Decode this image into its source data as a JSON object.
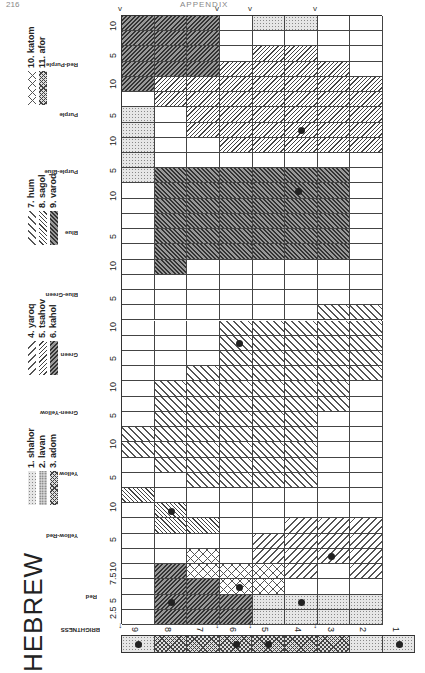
{
  "page": {
    "number": "216",
    "running_head": "APPENDIX"
  },
  "language_title": "HEBREW",
  "legend": [
    {
      "id": 1,
      "label": "1. shahor",
      "pattern": "stipple-light"
    },
    {
      "id": 2,
      "label": "2. lavan",
      "pattern": "stipple-medium"
    },
    {
      "id": 3,
      "label": "3. adom",
      "pattern": "stipple-dense"
    },
    {
      "id": 4,
      "label": "4. yaroq",
      "pattern": "diagonal-wide-back"
    },
    {
      "id": 5,
      "label": "5. tsahov",
      "pattern": "diagonal-narrow-back"
    },
    {
      "id": 6,
      "label": "6. kahol",
      "pattern": "diagonal-dense-back"
    },
    {
      "id": 7,
      "label": "7. hum",
      "pattern": "diagonal-wide-forward"
    },
    {
      "id": 8,
      "label": "8. sagol",
      "pattern": "diagonal-narrow-forward"
    },
    {
      "id": 9,
      "label": "9. varod",
      "pattern": "diagonal-dense-forward"
    },
    {
      "id": 10,
      "label": "10. katom",
      "pattern": "crosshatch-open"
    },
    {
      "id": 11,
      "label": "11. afor",
      "pattern": "crosshatch-dense"
    }
  ],
  "axes": {
    "brightness_label": "BRIGHTNESS",
    "hue_labels": [
      "Red-Purple",
      "Purple",
      "Purple-Blue",
      "Blue",
      "Blue-Green",
      "Green",
      "Green-Yellow",
      "Yellow",
      "Yellow-Red",
      "Red"
    ],
    "hue_ticks_top_to_bottom": [
      "10",
      "5",
      "10",
      "5",
      "10",
      "5",
      "10",
      "5",
      "10",
      "5",
      "10",
      "5",
      "10",
      "5",
      "10",
      "5",
      "10",
      "5",
      "10",
      "7.5",
      "5",
      "2.5"
    ],
    "brightness_ticks": [
      "9",
      "8",
      "7",
      "6",
      "5",
      "4",
      "3",
      "2",
      "1"
    ]
  },
  "chart_data": {
    "type": "heatmap",
    "title": "HEBREW",
    "xlabel": "BRIGHTNESS",
    "ylabel": "Hue (Munsell)",
    "x": [
      "9",
      "8",
      "7",
      "6",
      "5",
      "4",
      "3",
      "2"
    ],
    "y": [
      "10RP",
      "7.5RP",
      "5RP",
      "2.5RP",
      "10P",
      "7.5P",
      "5P",
      "2.5P",
      "10PB",
      "7.5PB",
      "5PB",
      "2.5PB",
      "10B",
      "7.5B",
      "5B",
      "2.5B",
      "10BG",
      "7.5BG",
      "5BG",
      "2.5BG",
      "10G",
      "7.5G",
      "5G",
      "2.5G",
      "10GY",
      "7.5GY",
      "5GY",
      "2.5GY",
      "10Y",
      "7.5Y",
      "5Y",
      "2.5Y",
      "10YR",
      "7.5YR",
      "5YR",
      "2.5YR",
      "10R",
      "7.5R",
      "5R",
      "2.5R"
    ],
    "legend_position": "left",
    "foci": [
      {
        "term": "shahor",
        "brightness": "1"
      },
      {
        "term": "lavan",
        "brightness": "9"
      },
      {
        "term": "afor",
        "brightness": "6"
      },
      {
        "term": "afor",
        "brightness": "5"
      },
      {
        "term": "adom",
        "hue": "5R",
        "brightness": "8"
      },
      {
        "term": "varod",
        "hue": "5R",
        "brightness": "4"
      },
      {
        "term": "katom",
        "hue": "10YR",
        "brightness": "6"
      },
      {
        "term": "tsahov",
        "hue": "5YR",
        "brightness": "3"
      },
      {
        "term": "tsahov",
        "hue": "2.5Y",
        "brightness": "8"
      },
      {
        "term": "yaroq",
        "hue": "10GY",
        "brightness": "5"
      },
      {
        "term": "kahol",
        "hue": "5PB",
        "brightness": "4"
      },
      {
        "term": "sagol",
        "hue": "5P",
        "brightness": "4"
      }
    ],
    "brightness_row": [
      "lavan",
      "afor",
      "afor",
      "afor",
      "afor",
      "afor",
      "afor",
      "shahor",
      "shahor"
    ]
  }
}
